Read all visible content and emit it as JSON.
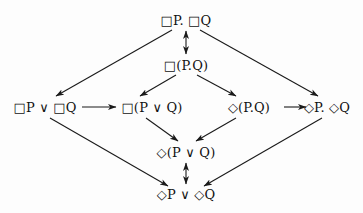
{
  "diagram": {
    "background_color": "#fdfdfd",
    "stroke_color": "#1a1a1a",
    "nodes": [
      {
        "id": "box-p-and-box-q",
        "label": "□P. □Q",
        "x": 186,
        "y": 20,
        "name": "node-box-p-and-box-q"
      },
      {
        "id": "box-p-and-q",
        "label": "□(P.Q)",
        "x": 186,
        "y": 65,
        "name": "node-box-p-and-q"
      },
      {
        "id": "box-p-or-box-q",
        "label": "□P ∨ □Q",
        "x": 45,
        "y": 107,
        "name": "node-box-p-or-box-q"
      },
      {
        "id": "box-p-or-q",
        "label": "□(P ∨ Q)",
        "x": 152,
        "y": 107,
        "name": "node-box-p-or-q"
      },
      {
        "id": "diamond-p-and-q",
        "label": "◇(P.Q)",
        "x": 249,
        "y": 107,
        "name": "node-diamond-p-and-q"
      },
      {
        "id": "diamond-p-and-diamond-q",
        "label": "◇P. ◇Q",
        "x": 327,
        "y": 107,
        "name": "node-diamond-p-and-diamond-q"
      },
      {
        "id": "diamond-p-or-q",
        "label": "◇(P ∨ Q)",
        "x": 186,
        "y": 152,
        "name": "node-diamond-p-or-q"
      },
      {
        "id": "diamond-p-or-diamond-q",
        "label": "◇P ∨ ◇Q",
        "x": 186,
        "y": 194,
        "name": "node-diamond-p-or-diamond-q"
      }
    ],
    "edges": [
      {
        "id": "e1",
        "from": "box-p-and-box-q",
        "to": "box-p-and-q",
        "kind": "bidirectional",
        "name": "edge-box-conj-equivalence"
      },
      {
        "id": "e2",
        "from": "box-p-and-box-q",
        "to": "box-p-or-box-q",
        "kind": "directed",
        "name": "edge-box-conj-to-box-disj"
      },
      {
        "id": "e3",
        "from": "box-p-and-box-q",
        "to": "diamond-p-and-diamond-q",
        "kind": "directed",
        "name": "edge-box-conj-to-diamond-conj"
      },
      {
        "id": "e4",
        "from": "box-p-and-q",
        "to": "box-p-or-q",
        "kind": "directed",
        "name": "edge-box-and-to-box-or"
      },
      {
        "id": "e5",
        "from": "box-p-and-q",
        "to": "diamond-p-and-q",
        "kind": "directed",
        "name": "edge-box-and-to-diamond-and"
      },
      {
        "id": "e6",
        "from": "box-p-or-box-q",
        "to": "box-p-or-q",
        "kind": "directed",
        "name": "edge-box-disj-to-box-or"
      },
      {
        "id": "e7",
        "from": "diamond-p-and-q",
        "to": "diamond-p-and-diamond-q",
        "kind": "directed",
        "name": "edge-diamond-and-to-diamond-conj"
      },
      {
        "id": "e8",
        "from": "box-p-or-q",
        "to": "diamond-p-or-q",
        "kind": "directed",
        "name": "edge-box-or-to-diamond-or"
      },
      {
        "id": "e9",
        "from": "diamond-p-and-q",
        "to": "diamond-p-or-q",
        "kind": "directed",
        "name": "edge-diamond-and-to-diamond-or"
      },
      {
        "id": "e10",
        "from": "box-p-or-box-q",
        "to": "diamond-p-or-diamond-q",
        "kind": "directed",
        "name": "edge-box-disj-to-diamond-disj"
      },
      {
        "id": "e11",
        "from": "diamond-p-and-diamond-q",
        "to": "diamond-p-or-diamond-q",
        "kind": "directed",
        "name": "edge-diamond-conj-to-diamond-disj"
      },
      {
        "id": "e12",
        "from": "diamond-p-or-q",
        "to": "diamond-p-or-diamond-q",
        "kind": "bidirectional",
        "name": "edge-diamond-disj-equivalence"
      }
    ]
  }
}
